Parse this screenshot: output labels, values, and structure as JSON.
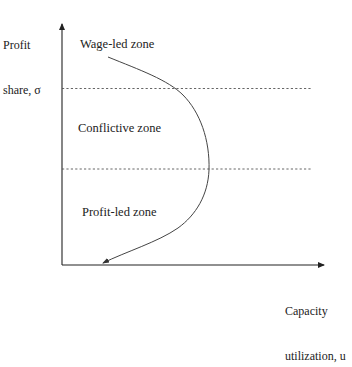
{
  "diagram": {
    "type": "regime-curve",
    "axes": {
      "y_label_line1": "Profit",
      "y_label_line2": "share, σ",
      "x_label_line1": "Capacity",
      "x_label_line2": "utilization, u"
    },
    "zones": [
      {
        "name": "wage-led",
        "label": "Wage-led zone"
      },
      {
        "name": "conflictive",
        "label": "Conflictive zone"
      },
      {
        "name": "profit-led",
        "label": "Profit-led zone"
      }
    ],
    "boundaries": [
      {
        "name": "upper-threshold",
        "style": "dashed"
      },
      {
        "name": "lower-threshold",
        "style": "dashed"
      }
    ],
    "curve": {
      "description": "Backward-bending curve bulging toward higher capacity utilization in the conflictive zone, arrow pointing down-left toward the horizontal axis"
    },
    "colors": {
      "line": "#333333",
      "dashed": "#555555",
      "text": "#222222",
      "background": "#ffffff"
    }
  }
}
